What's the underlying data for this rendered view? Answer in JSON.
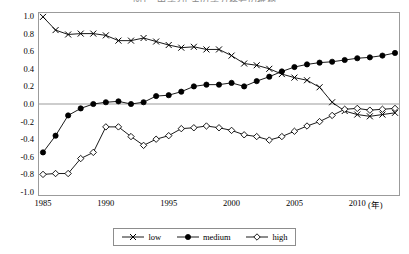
{
  "chart_title": "図1　中学3年生の学力格差の推移",
  "axis": {
    "y_ticks": [
      "1.0",
      "0.8",
      "0.6",
      "0.4",
      "0.2",
      "0.0",
      "-0.2",
      "-0.4",
      "-0.6",
      "-0.8",
      "-1.0"
    ],
    "y_tick_values": [
      1.0,
      0.8,
      0.6,
      0.4,
      0.2,
      0.0,
      -0.2,
      -0.4,
      -0.6,
      -0.8,
      -1.0
    ],
    "x_ticks": [
      "1985",
      "1990",
      "1995",
      "2000",
      "2005",
      "2010"
    ],
    "x_tick_values": [
      1985,
      1990,
      1995,
      2000,
      2005,
      2010
    ],
    "x_unit_label": "(年)"
  },
  "legend": {
    "position": "bottom-center",
    "items": [
      {
        "label": "low",
        "marker": "cross-x-marker",
        "color": "#000000"
      },
      {
        "label": "medium",
        "marker": "filled-circle-marker",
        "color": "#000000"
      },
      {
        "label": "high",
        "marker": "open-diamond-marker",
        "color": "#000000"
      }
    ]
  },
  "chart_data": {
    "type": "line",
    "title": "図1　中学3年生の学力格差の推移",
    "xlabel": "(年)",
    "ylabel": "",
    "xlim": [
      1985,
      2013
    ],
    "ylim": [
      -1.0,
      1.0
    ],
    "grid": false,
    "zero_line": true,
    "legend_position": "bottom-center",
    "x": [
      1985,
      1986,
      1987,
      1988,
      1989,
      1990,
      1991,
      1992,
      1993,
      1994,
      1995,
      1996,
      1997,
      1998,
      1999,
      2000,
      2001,
      2002,
      2003,
      2004,
      2005,
      2006,
      2007,
      2008,
      2009,
      2010,
      2011,
      2012,
      2013
    ],
    "series": [
      {
        "name": "low",
        "marker": "cross-x-marker",
        "style": "line-with-x-markers",
        "values": [
          0.99,
          0.84,
          0.79,
          0.8,
          0.8,
          0.78,
          0.72,
          0.72,
          0.75,
          0.71,
          0.67,
          0.64,
          0.65,
          0.62,
          0.62,
          0.55,
          0.46,
          0.44,
          0.4,
          0.34,
          0.3,
          0.27,
          0.19,
          0.02,
          -0.08,
          -0.12,
          -0.14,
          -0.12,
          -0.1
        ]
      },
      {
        "name": "medium",
        "marker": "filled-circle-marker",
        "style": "line-with-filled-circles",
        "values": [
          -0.55,
          -0.36,
          -0.13,
          -0.05,
          0.0,
          0.02,
          0.03,
          0.0,
          0.02,
          0.09,
          0.1,
          0.14,
          0.2,
          0.22,
          0.22,
          0.24,
          0.2,
          0.26,
          0.31,
          0.37,
          0.42,
          0.45,
          0.47,
          0.48,
          0.5,
          0.52,
          0.53,
          0.55,
          0.58
        ]
      },
      {
        "name": "high",
        "marker": "open-diamond-marker",
        "style": "line-with-open-diamonds",
        "values": [
          -0.8,
          -0.79,
          -0.79,
          -0.62,
          -0.55,
          -0.26,
          -0.26,
          -0.37,
          -0.47,
          -0.4,
          -0.36,
          -0.28,
          -0.27,
          -0.25,
          -0.27,
          -0.3,
          -0.35,
          -0.37,
          -0.41,
          -0.37,
          -0.31,
          -0.25,
          -0.2,
          -0.13,
          -0.06,
          -0.05,
          -0.07,
          -0.06,
          -0.05
        ]
      }
    ]
  }
}
